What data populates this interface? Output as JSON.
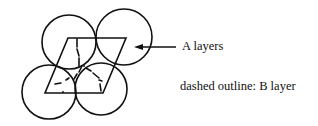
{
  "diagram": {
    "type": "packing-layers",
    "labels": {
      "a_layers": "A layers",
      "b_layer": "dashed outline: B layer"
    },
    "colors": {
      "stroke": "#111111",
      "background": "#ffffff"
    },
    "circles": [
      {
        "name": "top-left",
        "cx": 69,
        "cy": 42,
        "r": 27
      },
      {
        "name": "top-right",
        "cx": 124,
        "cy": 37,
        "r": 28
      },
      {
        "name": "bottom-left",
        "cx": 49,
        "cy": 92,
        "r": 27
      },
      {
        "name": "bottom-right",
        "cx": 101,
        "cy": 89,
        "r": 26
      }
    ],
    "parallelogram": [
      [
        68,
        38
      ],
      [
        126,
        38
      ],
      [
        103,
        93
      ],
      [
        45,
        93
      ]
    ],
    "arrow": {
      "from": [
        176,
        47
      ],
      "to": [
        134,
        47
      ]
    },
    "dashed_segments": [
      [
        [
          77,
          39
        ],
        [
          77,
          47
        ]
      ],
      [
        [
          77,
          49
        ],
        [
          79,
          56
        ]
      ],
      [
        [
          79,
          58
        ],
        [
          79,
          66
        ]
      ],
      [
        [
          82,
          66
        ],
        [
          79,
          72
        ]
      ],
      [
        [
          77,
          74
        ],
        [
          74,
          79
        ]
      ],
      [
        [
          86,
          68
        ],
        [
          91,
          71
        ]
      ],
      [
        [
          93,
          73
        ],
        [
          99,
          78
        ]
      ],
      [
        [
          99,
          80
        ],
        [
          102,
          81
        ]
      ],
      [
        [
          100,
          84
        ],
        [
          101,
          91
        ]
      ],
      [
        [
          55,
          84
        ],
        [
          61,
          83
        ]
      ],
      [
        [
          66,
          80
        ],
        [
          69,
          78
        ]
      ]
    ],
    "dots": [
      [
        63,
        92
      ],
      [
        84,
        66
      ]
    ]
  }
}
